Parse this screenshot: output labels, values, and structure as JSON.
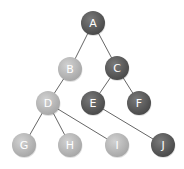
{
  "diagram": {
    "type": "tree",
    "colors": {
      "dark_node": "#5a5a5a",
      "dark_node_highlight": "#7a7a7a",
      "light_node": "#b5b5b5",
      "light_node_highlight": "#d2d2d2",
      "edge": "#666666",
      "label": "#ffffff"
    },
    "node_radius": 12,
    "nodes": [
      {
        "id": "A",
        "label": "A",
        "x": 93,
        "y": 23,
        "shade": "dark"
      },
      {
        "id": "B",
        "label": "B",
        "x": 70,
        "y": 69,
        "shade": "light"
      },
      {
        "id": "C",
        "label": "C",
        "x": 117,
        "y": 68,
        "shade": "dark"
      },
      {
        "id": "D",
        "label": "D",
        "x": 48,
        "y": 103,
        "shade": "light"
      },
      {
        "id": "E",
        "label": "E",
        "x": 93,
        "y": 103,
        "shade": "dark"
      },
      {
        "id": "F",
        "label": "F",
        "x": 139,
        "y": 103,
        "shade": "dark"
      },
      {
        "id": "G",
        "label": "G",
        "x": 24,
        "y": 145,
        "shade": "light"
      },
      {
        "id": "H",
        "label": "H",
        "x": 70,
        "y": 145,
        "shade": "light"
      },
      {
        "id": "I",
        "label": "I",
        "x": 117,
        "y": 145,
        "shade": "light"
      },
      {
        "id": "J",
        "label": "J",
        "x": 163,
        "y": 145,
        "shade": "dark"
      }
    ],
    "edges": [
      {
        "from": "A",
        "to": "B"
      },
      {
        "from": "A",
        "to": "C"
      },
      {
        "from": "B",
        "to": "D"
      },
      {
        "from": "C",
        "to": "E"
      },
      {
        "from": "C",
        "to": "F"
      },
      {
        "from": "D",
        "to": "G"
      },
      {
        "from": "D",
        "to": "H"
      },
      {
        "from": "D",
        "to": "I"
      },
      {
        "from": "E",
        "to": "J"
      }
    ]
  }
}
